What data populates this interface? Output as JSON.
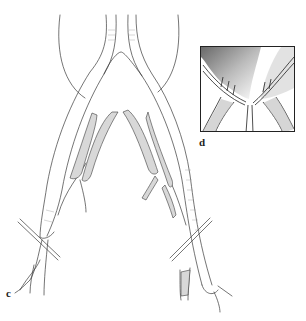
{
  "figure": {
    "type": "medical-illustration",
    "panels": [
      {
        "id": "c",
        "label": "c"
      },
      {
        "id": "d",
        "label": "d"
      }
    ],
    "colors": {
      "line": "#3a3a3a",
      "graft_fill": "#d8d8d8",
      "background": "#ffffff",
      "inset_shade": "#555555"
    }
  }
}
